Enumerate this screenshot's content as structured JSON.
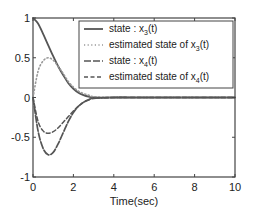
{
  "chart_data": {
    "type": "line",
    "title": "",
    "xlabel": "Time(sec)",
    "ylabel": "",
    "xlim": [
      0,
      10
    ],
    "ylim": [
      -1,
      1
    ],
    "xticks": [
      0,
      2,
      4,
      6,
      8,
      10
    ],
    "xtick_labels": [
      "0",
      "2",
      "4",
      "6",
      "8",
      "10"
    ],
    "yticks": [
      1,
      0.5,
      0,
      -0.5,
      -1
    ],
    "ytick_labels": [
      "1",
      "0.5",
      "0",
      "-0.5",
      "-1"
    ],
    "grid": false,
    "legend_position": "upper right",
    "x": [
      0,
      0.25,
      0.5,
      0.75,
      1.0,
      1.25,
      1.5,
      1.75,
      2.0,
      2.25,
      2.5,
      2.75,
      3.0,
      4,
      5,
      6,
      7,
      8,
      9,
      10
    ],
    "series": [
      {
        "name": "state : x3(t)",
        "legend_main": "state : x",
        "legend_sub": "3",
        "legend_tail": "(t)",
        "style": "solid",
        "color": "#555555",
        "values": [
          1.0,
          0.93,
          0.8,
          0.66,
          0.52,
          0.39,
          0.28,
          0.18,
          0.11,
          0.06,
          0.03,
          0.01,
          0.0,
          0.0,
          0.0,
          0.0,
          0.0,
          0.0,
          0.0,
          0.0
        ]
      },
      {
        "name": "estimated state of x3(t)",
        "legend_main": "estimated state of x",
        "legend_sub": "3",
        "legend_tail": "(t)",
        "style": "dotted",
        "color": "#999999",
        "values": [
          0.0,
          0.33,
          0.46,
          0.5,
          0.47,
          0.39,
          0.3,
          0.2,
          0.13,
          0.08,
          0.05,
          0.03,
          0.01,
          0.0,
          0.0,
          0.0,
          0.0,
          0.0,
          0.0,
          0.0
        ]
      },
      {
        "name": "state : x4(t)",
        "legend_main": "state : x",
        "legend_sub": "4",
        "legend_tail": "(t)",
        "style": "dashdot",
        "color": "#555555",
        "values": [
          0.0,
          -0.42,
          -0.64,
          -0.72,
          -0.69,
          -0.58,
          -0.44,
          -0.3,
          -0.19,
          -0.11,
          -0.06,
          -0.03,
          -0.01,
          0.0,
          0.0,
          0.0,
          0.0,
          0.0,
          0.0,
          0.0
        ]
      },
      {
        "name": "estimated state of x4(t)",
        "legend_main": "estimated state of x",
        "legend_sub": "4",
        "legend_tail": "(t)",
        "style": "dashed",
        "color": "#555555",
        "values": [
          0.0,
          -0.3,
          -0.42,
          -0.45,
          -0.43,
          -0.38,
          -0.31,
          -0.24,
          -0.17,
          -0.11,
          -0.06,
          -0.03,
          -0.01,
          0.0,
          0.0,
          0.0,
          0.0,
          0.0,
          0.0,
          0.0
        ]
      }
    ]
  }
}
